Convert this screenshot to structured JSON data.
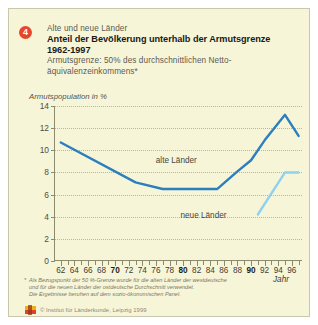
{
  "figure": {
    "badge_number": "4",
    "kicker": "Alte und neue Länder",
    "title_line1": "Anteil der Bevölkerung unterhalb der Armutsgrenze",
    "title_line2": "1962-1997",
    "subtitle_line1": "Armutsgrenze: 50% des durchschnittlichen Netto-",
    "subtitle_line2": "äquivalenzeinkommens*",
    "footnote_star": "*",
    "footnote_line1": "Als Bezugspunkt der 50 %-Grenze wurde für die alten Länder der westdeutsche",
    "footnote_line2": "und für die neuen Länder der ostdeutsche Durchschnitt verwendet.",
    "footnote_line3": "Die Ergebnisse beruhen auf dem sozio-ökonomischen Panel.",
    "copyright": "© Institut für Länderkunde, Leipzig 1999",
    "logo_name": "institut-fuer-laenderkunde-logo"
  },
  "chart_data": {
    "type": "line",
    "title": "Anteil der Bevölkerung unterhalb der Armutsgrenze 1962-1997",
    "ylabel": "Armutspopulation in %",
    "xlabel": "Jahr",
    "ylim": [
      0,
      14
    ],
    "xlim": [
      1961,
      1997.5
    ],
    "grid": true,
    "legend": "inline-annotations",
    "ytick_values": [
      0,
      2,
      4,
      6,
      8,
      10,
      12,
      14
    ],
    "ytick_labels": [
      "0",
      "2",
      "4",
      "6",
      "8",
      "10",
      "12",
      "14"
    ],
    "xtick_values": [
      1962,
      1964,
      1966,
      1968,
      1970,
      1972,
      1974,
      1976,
      1978,
      1980,
      1982,
      1984,
      1986,
      1988,
      1990,
      1992,
      1994,
      1996
    ],
    "xtick_labels": [
      "62",
      "64",
      "66",
      "68",
      "70",
      "72",
      "74",
      "76",
      "78",
      "80",
      "82",
      "84",
      "86",
      "88",
      "90",
      "92",
      "94",
      "96"
    ],
    "xtick_bold": [
      "70",
      "80",
      "90"
    ],
    "colors": {
      "alte_laender": "#2b7fbf",
      "neue_laender": "#8fd2ef",
      "axis": "#8d8b6e",
      "grid": "#b9b79a",
      "background": "#f7f5d8",
      "badge": "#e8462a"
    },
    "series": [
      {
        "name": "alte Länder",
        "color": "#2b7fbf",
        "label_x": 1979,
        "label_y": 9.1,
        "x": [
          1962,
          1973,
          1977,
          1985,
          1988,
          1990,
          1992,
          1995,
          1997
        ],
        "values": [
          10.7,
          7.1,
          6.5,
          6.5,
          8.1,
          9.1,
          10.9,
          13.2,
          11.3
        ]
      },
      {
        "name": "neue Länder",
        "color": "#8fd2ef",
        "label_x": 1983,
        "label_y": 4.2,
        "x": [
          1991,
          1995,
          1997
        ],
        "values": [
          4.2,
          8.0,
          8.0
        ]
      }
    ]
  }
}
